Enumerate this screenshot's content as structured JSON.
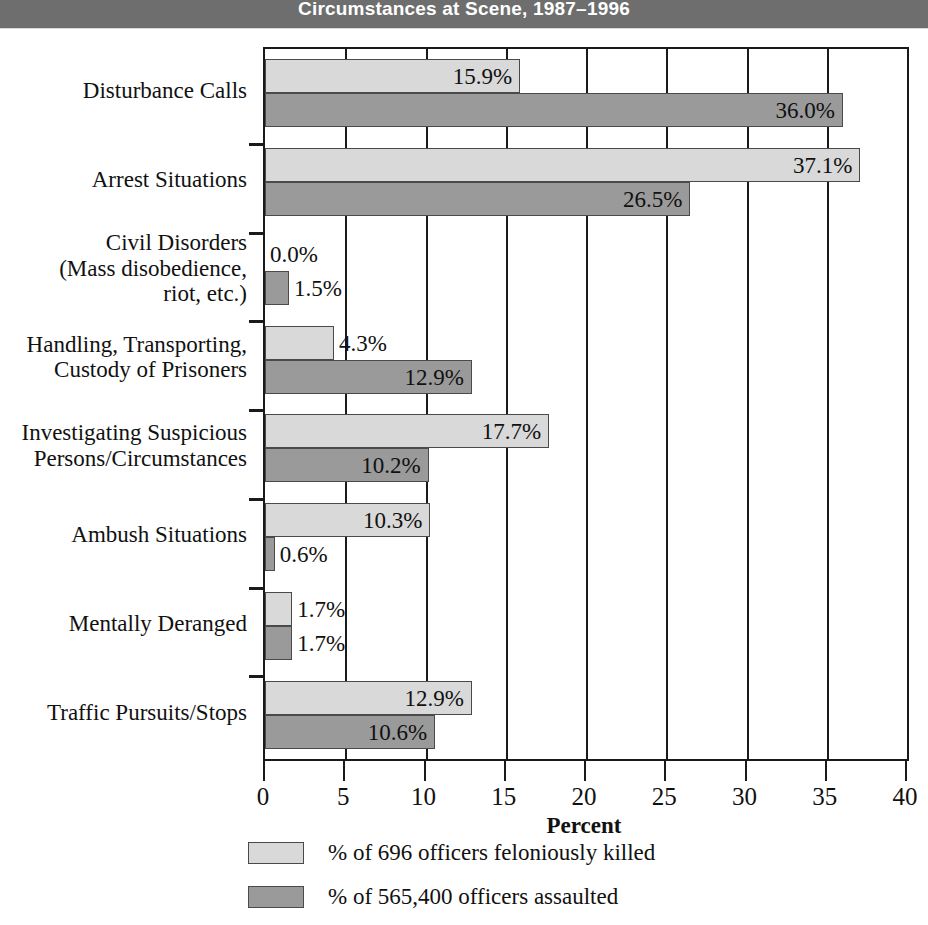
{
  "title": "Circumstances at Scene, 1987–1996",
  "colors": {
    "banner": "#6e6e6e",
    "banner_text": "#ffffff",
    "series_light": "#d9d9d9",
    "series_dark": "#9a9a9a",
    "axis": "#1a1a1a",
    "text": "#111111"
  },
  "axis": {
    "xlabel": "Percent",
    "ticks": [
      "0",
      "5",
      "10",
      "15",
      "20",
      "25",
      "30",
      "35",
      "40"
    ]
  },
  "legend": {
    "items": [
      {
        "label": "% of  696 officers feloniously killed",
        "swatch": "light"
      },
      {
        "label": "% of 565,400 officers assaulted",
        "swatch": "dark"
      }
    ]
  },
  "chart_data": {
    "type": "bar",
    "orientation": "horizontal",
    "title": "Circumstances at Scene, 1987–1996",
    "xlabel": "Percent",
    "ylabel": "",
    "xlim": [
      0,
      40
    ],
    "xticks": [
      0,
      5,
      10,
      15,
      20,
      25,
      30,
      35,
      40
    ],
    "grid": true,
    "legend_position": "bottom",
    "categories": [
      "Disturbance Calls",
      "Arrest Situations",
      "Civil Disorders\n(Mass disobedience,\nriot, etc.)",
      "Handling, Transporting,\nCustody of Prisoners",
      "Investigating Suspicious\nPersons/Circumstances",
      "Ambush Situations",
      "Mentally Deranged",
      "Traffic Pursuits/Stops"
    ],
    "series": [
      {
        "name": "% of  696 officers feloniously killed",
        "color": "#d9d9d9",
        "values": [
          15.9,
          37.1,
          0.0,
          4.3,
          17.7,
          10.3,
          1.7,
          12.9
        ],
        "labels": [
          "15.9%",
          "37.1%",
          "0.0%",
          "4.3%",
          "17.7%",
          "10.3%",
          "1.7%",
          "12.9%"
        ]
      },
      {
        "name": "% of 565,400 officers assaulted",
        "color": "#9a9a9a",
        "values": [
          36.0,
          26.5,
          1.5,
          12.9,
          10.2,
          0.6,
          1.7,
          10.6
        ],
        "labels": [
          "36.0%",
          "26.5%",
          "1.5%",
          "12.9%",
          "10.2%",
          "0.6%",
          "1.7%",
          "10.6%"
        ]
      }
    ]
  }
}
